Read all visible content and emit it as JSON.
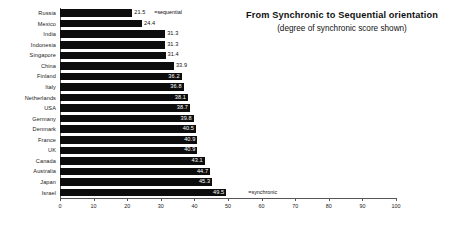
{
  "header": {
    "title": "From  Synchronic to Sequential orientation",
    "subtitle": "(degree of synchronic score shown)"
  },
  "annotations": {
    "top_note": "=sequential",
    "bottom_note": "=synchronic"
  },
  "colors": {
    "bar": "#0d0d0d",
    "axis": "#555555",
    "text": "#1a1a1a",
    "background": "#ffffff"
  },
  "chart_data": {
    "type": "bar",
    "orientation": "horizontal",
    "title": "From  Synchronic to Sequential orientation",
    "subtitle": "(degree of synchronic score shown)",
    "xlabel": "",
    "ylabel": "",
    "xlim": [
      0,
      100
    ],
    "xticks": [
      0,
      10,
      20,
      30,
      40,
      50,
      60,
      70,
      80,
      90,
      100
    ],
    "grid": false,
    "legend": "none",
    "categories": [
      "Russia",
      "Mexico",
      "India",
      "Indonesia",
      "Singapore",
      "China",
      "Finland",
      "Italy",
      "Netherlands",
      "USA",
      "Germany",
      "Denmark",
      "France",
      "UK",
      "Canada",
      "Australia",
      "Japan",
      "Israel"
    ],
    "values": [
      21.5,
      24.4,
      31.3,
      31.3,
      31.4,
      33.9,
      36.2,
      36.8,
      38.1,
      38.7,
      39.8,
      40.5,
      40.9,
      40.9,
      43.1,
      44.7,
      45.3,
      49.5
    ],
    "value_labels": [
      "21.5",
      "24.4",
      "31.3",
      "31.3",
      "31.4",
      "33.9",
      "36.2",
      "36.8",
      "38.1",
      "38.7",
      "39.8",
      "40.5",
      "40.9",
      "40.9",
      "43.1",
      "44.7",
      "45.3",
      "49.5"
    ],
    "annotations": [
      {
        "category": "Russia",
        "text": "=sequential"
      },
      {
        "category": "Israel",
        "text": "=synchronic"
      }
    ]
  }
}
